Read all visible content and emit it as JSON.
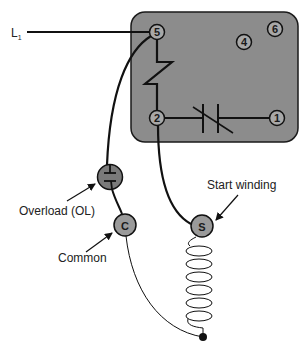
{
  "colors": {
    "relay_body": "#8c8c8c",
    "relay_border": "#1a1a1a",
    "terminal_fill": "#a8a8a8",
    "overload_fill": "#7a7a7a",
    "wire": "#111111"
  },
  "line_label": {
    "main": "L",
    "sub": "1"
  },
  "relay": {
    "terminals": [
      {
        "id": "5",
        "label": "5"
      },
      {
        "id": "4",
        "label": "4"
      },
      {
        "id": "6",
        "label": "6"
      },
      {
        "id": "2",
        "label": "2"
      },
      {
        "id": "1",
        "label": "1"
      }
    ],
    "components": [
      "coil",
      "normally-closed contacts"
    ]
  },
  "components": {
    "overload": {
      "label": "Overload (OL)"
    },
    "common": {
      "label": "Common",
      "terminal": "C"
    },
    "start_winding": {
      "label": "Start winding",
      "terminal": "S"
    }
  }
}
